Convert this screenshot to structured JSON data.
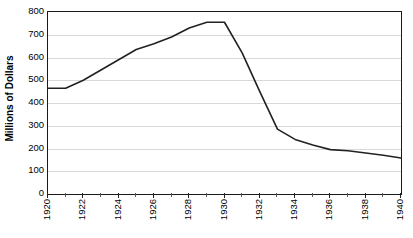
{
  "chart_data": {
    "type": "line",
    "title": "",
    "xlabel": "",
    "ylabel": "Millions of Dollars",
    "xlim": [
      1920,
      1940
    ],
    "ylim": [
      0,
      800
    ],
    "grid": true,
    "legend": false,
    "line_color": "#222222",
    "x": [
      1920,
      1921,
      1922,
      1923,
      1924,
      1925,
      1926,
      1927,
      1928,
      1929,
      1930,
      1931,
      1932,
      1933,
      1934,
      1935,
      1936,
      1937,
      1938,
      1939,
      1940
    ],
    "values": [
      465,
      465,
      500,
      545,
      590,
      635,
      660,
      690,
      730,
      755,
      755,
      620,
      450,
      285,
      240,
      215,
      195,
      190,
      180,
      170,
      158
    ],
    "series": [
      {
        "name": "Millions of Dollars",
        "values": [
          465,
          465,
          500,
          545,
          590,
          635,
          660,
          690,
          730,
          755,
          755,
          620,
          450,
          285,
          240,
          215,
          195,
          190,
          180,
          170,
          158
        ]
      }
    ],
    "y_ticks": [
      0,
      100,
      200,
      300,
      400,
      500,
      600,
      700,
      800
    ],
    "y_tick_labels": [
      "0",
      "100",
      "200",
      "300",
      "400",
      "500",
      "600",
      "700",
      "800"
    ],
    "x_tick_labels": [
      "1920",
      "1922",
      "1924",
      "1926",
      "1928",
      "1930",
      "1932",
      "1934",
      "1936",
      "1938",
      "1940"
    ],
    "x_tick_values": [
      1920,
      1922,
      1924,
      1926,
      1928,
      1930,
      1932,
      1934,
      1936,
      1938,
      1940
    ]
  }
}
